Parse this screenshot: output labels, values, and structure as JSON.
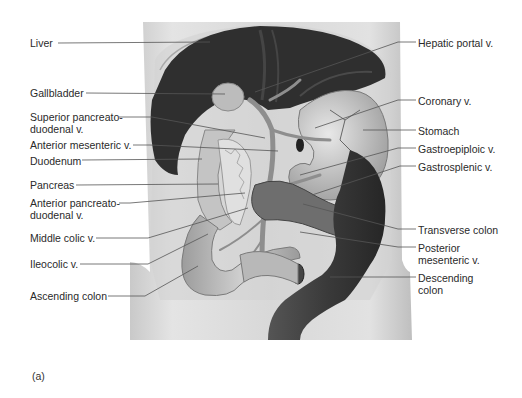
{
  "figure": {
    "caption": "(a)"
  },
  "labels_left": [
    {
      "id": "liver",
      "text": "Liver",
      "x": 30,
      "y": 37
    },
    {
      "id": "gallbladder",
      "text": "Gallbladder",
      "x": 30,
      "y": 87
    },
    {
      "id": "superior-pancreatoduodenal",
      "text": "Superior pancreato-",
      "text2": "duodenal v.",
      "x": 30,
      "y": 111
    },
    {
      "id": "anterior-mesenteric",
      "text": "Anterior mesenteric v.",
      "x": 30,
      "y": 139
    },
    {
      "id": "duodenum",
      "text": "Duodenum",
      "x": 30,
      "y": 155
    },
    {
      "id": "pancreas",
      "text": "Pancreas",
      "x": 30,
      "y": 179
    },
    {
      "id": "anterior-pancreatoduodenal",
      "text": "Anterior pancreato-",
      "text2": "duodenal v.",
      "x": 30,
      "y": 197
    },
    {
      "id": "middle-colic",
      "text": "Middle colic v.",
      "x": 30,
      "y": 232
    },
    {
      "id": "ileocolic",
      "text": "Ileocolic v.",
      "x": 30,
      "y": 258
    },
    {
      "id": "ascending-colon",
      "text": "Ascending colon",
      "x": 30,
      "y": 290
    }
  ],
  "labels_right": [
    {
      "id": "hepatic-portal",
      "text": "Hepatic portal v.",
      "x": 418,
      "y": 37
    },
    {
      "id": "coronary",
      "text": "Coronary v.",
      "x": 418,
      "y": 95
    },
    {
      "id": "stomach",
      "text": "Stomach",
      "x": 418,
      "y": 125
    },
    {
      "id": "gastroepiploic",
      "text": "Gastroepiploic v.",
      "x": 418,
      "y": 143
    },
    {
      "id": "gastrosplenic",
      "text": "Gastrosplenic v.",
      "x": 418,
      "y": 161
    },
    {
      "id": "transverse-colon",
      "text": "Transverse colon",
      "x": 418,
      "y": 224
    },
    {
      "id": "posterior-mesenteric",
      "text": "Posterior",
      "text2": "mesenteric v.",
      "x": 418,
      "y": 242
    },
    {
      "id": "descending-colon",
      "text": "Descending",
      "text2": "colon",
      "x": 418,
      "y": 272
    }
  ],
  "colors": {
    "background": "#ffffff",
    "body_outline": "#c8c8c8",
    "liver": "#2e2e2e",
    "organ_light": "#bdbdbd",
    "colon_dark": "#3a3a3a",
    "leader": "#555555"
  }
}
